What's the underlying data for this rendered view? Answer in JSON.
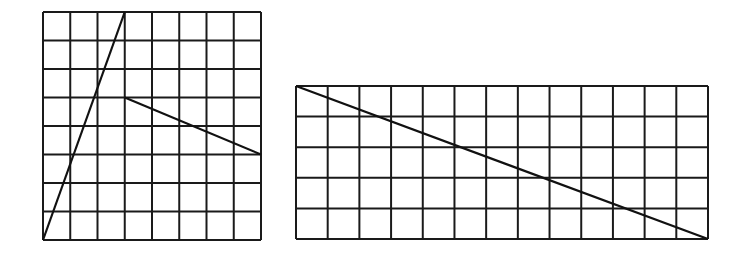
{
  "diagram": {
    "grids": [
      {
        "id": "left-grid",
        "columns": 8,
        "rows": 8,
        "segments": [
          {
            "name": "steep-segment",
            "from": [
              0,
              0
            ],
            "to": [
              3,
              8
            ]
          },
          {
            "name": "shallow-segment",
            "from": [
              3,
              5
            ],
            "to": [
              8,
              3
            ]
          }
        ]
      },
      {
        "id": "right-grid",
        "columns": 13,
        "rows": 5,
        "segments": [
          {
            "name": "diagonal-segment",
            "from": [
              0,
              5
            ],
            "to": [
              13,
              0
            ]
          }
        ]
      }
    ],
    "colors": {
      "line": "#111111",
      "background": "#ffffff"
    }
  }
}
